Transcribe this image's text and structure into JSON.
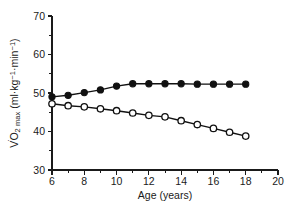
{
  "chart_data": {
    "type": "line",
    "title": "",
    "subtitle": "",
    "xlabel": "Age (years)",
    "ylabel": "VO2 max (ml·kg-1·min-1)",
    "ylabel_parts": {
      "v": "V",
      "o": "O",
      "o_sub": "2",
      "max": " max",
      "open_paren": " (ml·kg",
      "sup1": "−1",
      "mid": "·min",
      "sup2": "−1",
      "close_paren": ")"
    },
    "x": [
      6,
      7,
      8,
      9,
      10,
      11,
      12,
      13,
      14,
      15,
      16,
      17,
      18
    ],
    "xlim": [
      6,
      20
    ],
    "ylim": [
      30,
      70
    ],
    "xticks": [
      6,
      8,
      10,
      12,
      14,
      16,
      18,
      20
    ],
    "xticklabels": [
      "6",
      "8",
      "10",
      "12",
      "14",
      "16",
      "18",
      "20"
    ],
    "xminor_ticks": [
      7,
      9,
      11,
      13,
      15,
      17,
      19
    ],
    "yticks": [
      30,
      40,
      50,
      60,
      70
    ],
    "yticklabels": [
      "30",
      "40",
      "50",
      "60",
      "70"
    ],
    "yminor_ticks": [
      35,
      45,
      55,
      65
    ],
    "grid": false,
    "legend": false,
    "legend_position": "none",
    "series": [
      {
        "name": "Boys",
        "marker": "filled-circle",
        "color": "#111111",
        "values": [
          49.0,
          49.4,
          50.1,
          50.8,
          51.8,
          52.4,
          52.4,
          52.4,
          52.4,
          52.3,
          52.3,
          52.3,
          52.3
        ]
      },
      {
        "name": "Girls",
        "marker": "open-circle",
        "color": "#111111",
        "values": [
          47.2,
          46.7,
          46.4,
          45.9,
          45.4,
          44.8,
          44.2,
          43.8,
          42.8,
          41.8,
          40.8,
          39.8,
          38.8
        ]
      }
    ]
  }
}
